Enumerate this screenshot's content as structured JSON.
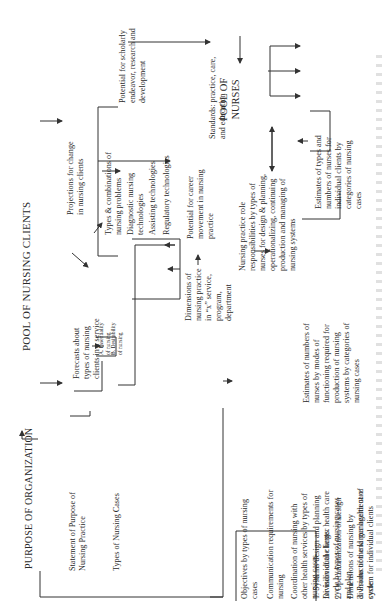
{
  "title": "POOL OF NURSING CLIENTS",
  "purpose": "PURPOSE OF  ORGANIZATION",
  "pool_nurses": [
    "POOL OF",
    "NURSES"
  ],
  "statement": [
    "Statement of Purpose of",
    "Nursing Practice"
  ],
  "types_cases": "Types of Nursing Cases",
  "case_a": [
    "A. Essentiality",
    "of nursing"
  ],
  "case_b": [
    "B. Desirability",
    "of nursing"
  ],
  "forecasts": [
    "Forecasts about",
    "types of nursing",
    "clients in a service"
  ],
  "projections": [
    "Projections for change",
    "in nursing clients"
  ],
  "types_combos": [
    "Types & combinations of",
    "nursing problems"
  ],
  "tech_diag": [
    "Diagnostic nursing",
    "technologies"
  ],
  "tech_assist": "Assisting technologies",
  "tech_reg": "Regulatory technologies",
  "scholarly": [
    "Potential  for scholarly",
    "endeavor, research and",
    "development"
  ],
  "standards": [
    "Standards: practice, care,",
    "and education"
  ],
  "objectives": [
    "Objectives by types of nursing",
    "cases"
  ],
  "communication": [
    "Communication requirements for",
    "nursing"
  ],
  "coordination": [
    "Coordination of nursing with",
    "other health services by types of",
    "nursing cases"
  ],
  "division": [
    "Division of the larger health care",
    "cycle by types of nursing cases"
  ],
  "dimensions_div": [
    "Dimensions of nursing by",
    "divisions of the larger health care",
    "cycle"
  ],
  "dimensions_practice": [
    "Dimensions of",
    "nursing practice",
    "in “x” service,",
    "program,",
    "department"
  ],
  "career": [
    "Potential for career",
    "movement in nursing",
    "practice"
  ],
  "role": [
    "Nursing  practice  role",
    "responsibilities by types of",
    "nurses for design & planning,",
    "operationalizing, continuing",
    "production and managing of",
    "nursing systems"
  ],
  "estimates_types": [
    "Estimates of types and",
    "numbers of nurses for",
    "individual clients by",
    "categories of nursing",
    "cases"
  ],
  "estimates_modes": [
    "Estimates of numbers of",
    "nurses by modes of",
    "functioning required for",
    "production of nursing",
    "systems by categories of",
    "nursing cases"
  ],
  "step1": [
    "1. Systems design and  planning",
    "for individual clients."
  ],
  "step2": [
    "2. Operationalization of design",
    "and plan"
  ],
  "step3": [
    "3. Production and management of",
    "system for individual clients"
  ]
}
